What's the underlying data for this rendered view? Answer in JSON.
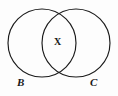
{
  "figure": {
    "type": "venn-diagram",
    "background_color": "#fdfdfd",
    "stroke_color": "#1a1a1a",
    "width": 118,
    "height": 96
  },
  "sets": [
    {
      "id": "left",
      "label": "B",
      "center_x": 42,
      "center_y": 43,
      "radius": 34
    },
    {
      "id": "right",
      "label": "C",
      "center_x": 76,
      "center_y": 43,
      "radius": 34
    }
  ],
  "labels": {
    "left_set": "B",
    "right_set": "C",
    "intersection": "X"
  }
}
